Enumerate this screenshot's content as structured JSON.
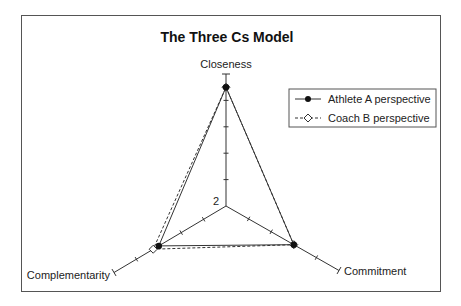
{
  "chart_data": {
    "type": "radar",
    "title": "The Three Cs Model",
    "axes": [
      "Closeness",
      "Commitment",
      "Complementarity"
    ],
    "axis_range": [
      2,
      7
    ],
    "axis_min_label": "2",
    "ticks": [
      3,
      4,
      5,
      6,
      7
    ],
    "grid": false,
    "legend_position": "upper right",
    "series": [
      {
        "name": "Athlete A perspective",
        "values": [
          6.5,
          5,
          5
        ],
        "line": "solid",
        "marker": "filled-circle"
      },
      {
        "name": "Coach B perspective",
        "values": [
          6.5,
          5,
          5.25
        ],
        "line": "dashed",
        "marker": "open-diamond"
      }
    ]
  },
  "colors": {
    "line": "#333333",
    "frame": "#555555",
    "background": "#ffffff"
  }
}
